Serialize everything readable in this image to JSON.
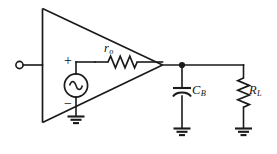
{
  "figure": {
    "name": "amplifier-output-equivalent-circuit",
    "background_color": "#ffffff",
    "line_color": "#1a1a1a",
    "width": 277,
    "height": 154
  },
  "labels": {
    "output_resistance": {
      "symbol": "r",
      "subscript": "o",
      "text": "ro"
    },
    "bypass_capacitor": {
      "symbol": "C",
      "subscript": "B",
      "text": "CB"
    },
    "load_resistor": {
      "symbol": "R",
      "subscript": "L",
      "text": "RL"
    },
    "source_plus": "+",
    "source_minus": "−"
  },
  "components": [
    {
      "name": "amplifier-triangle",
      "type": "triangle",
      "description": "op-amp / amplifier triangle symbol pointing right"
    },
    {
      "name": "input-terminal",
      "type": "open-terminal",
      "description": "open circle input terminal at far left"
    },
    {
      "name": "ac-voltage-source",
      "type": "ac-source",
      "description": "circle with sine wave, dependent/independent source"
    },
    {
      "name": "output-resistor-ro",
      "type": "resistor",
      "orientation": "horizontal",
      "label": "ro"
    },
    {
      "name": "bypass-capacitor-cb",
      "type": "capacitor",
      "orientation": "vertical",
      "label": "CB"
    },
    {
      "name": "load-resistor-rl",
      "type": "resistor",
      "orientation": "vertical",
      "label": "RL"
    },
    {
      "name": "ground-source",
      "type": "ground"
    },
    {
      "name": "ground-capacitor",
      "type": "ground"
    },
    {
      "name": "ground-load",
      "type": "ground"
    }
  ],
  "nodes": [
    {
      "name": "output-node",
      "type": "junction-dot"
    }
  ]
}
